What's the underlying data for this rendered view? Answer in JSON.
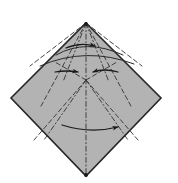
{
  "figure": {
    "type": "origami-folding-diagram",
    "canvas": {
      "width": 178,
      "height": 183,
      "background": "#ffffff"
    }
  },
  "colors": {
    "paper_fill": "#b3b3b3",
    "paper_outline": "#262626",
    "fold_line": "#333333",
    "arrow": "#1a1a1a",
    "background": "#ffffff"
  },
  "shape": {
    "name": "kite-diamond",
    "vertices": {
      "top": {
        "x": 86,
        "y": 23
      },
      "left": {
        "x": 11,
        "y": 98
      },
      "bottom": {
        "x": 86,
        "y": 176
      },
      "right": {
        "x": 161,
        "y": 98
      }
    },
    "points_attr": "86,23 161,98 86,176 11,98"
  },
  "nodes": {
    "apex": {
      "x": 86,
      "y": 23
    },
    "hub": {
      "x": 86,
      "y": 80
    },
    "left_anchor": {
      "x": 46,
      "y": 72
    },
    "right_anchor": {
      "x": 126,
      "y": 72
    }
  },
  "fold_lines": [
    {
      "name": "center-vertical-crease",
      "d": "M 86 23 L 86 176",
      "style": "dash-dot"
    },
    {
      "name": "apex-fan-left-outer",
      "d": "M 86 23 L 40 108",
      "style": "dashed"
    },
    {
      "name": "apex-fan-left-inner",
      "d": "M 86 23 L 63 82",
      "style": "dash-dot"
    },
    {
      "name": "apex-fan-right-inner",
      "d": "M 86 23 L 109 82",
      "style": "dash-dot"
    },
    {
      "name": "apex-fan-right-outer",
      "d": "M 86 23 L 132 108",
      "style": "dashed"
    },
    {
      "name": "hub-fan-left-outer",
      "d": "M 86 80 L 34 140",
      "style": "dashed"
    },
    {
      "name": "hub-fan-left-mid",
      "d": "M 86 80 L 44 140",
      "style": "dash-dot"
    },
    {
      "name": "hub-fan-right-mid",
      "d": "M 86 80 L 128 140",
      "style": "dash-dot"
    },
    {
      "name": "hub-fan-right-outer",
      "d": "M 86 80 L 138 140",
      "style": "dashed"
    },
    {
      "name": "upper-left-edge-crease",
      "d": "M 86 23 L 30 66",
      "style": "dashed"
    },
    {
      "name": "upper-right-edge-crease",
      "d": "M 86 23 L 142 66",
      "style": "dashed"
    },
    {
      "name": "hub-left-spur",
      "d": "M 86 80 L 55 62",
      "style": "dashed"
    },
    {
      "name": "hub-right-spur",
      "d": "M 86 80 L 117 62",
      "style": "dashed"
    }
  ],
  "arcs": [
    {
      "name": "upper-valley-arc",
      "d": "M 56 55 Q 86 38 123 55",
      "style": "solid"
    },
    {
      "name": "mid-wide-arc",
      "d": "M 40 66 Q 86 46 134 64",
      "style": "solid"
    }
  ],
  "arrows": [
    {
      "name": "upper-fold-arrow",
      "label": "fold top flap to the right",
      "direction": "right",
      "path": "M 66 48 Q 80 42 95 46",
      "head": {
        "x": 95,
        "y": 46,
        "angle": 18
      }
    },
    {
      "name": "left-converging-arrow",
      "label": "fold left side inward to center",
      "direction": "right",
      "path": "M 55 72 Q 66 70 78 72",
      "head": {
        "x": 79,
        "y": 72,
        "angle": 8
      }
    },
    {
      "name": "right-converging-arrow",
      "label": "fold right side inward to center",
      "direction": "left",
      "path": "M 118 72 Q 104 68 93 72",
      "head": {
        "x": 92,
        "y": 72,
        "angle": 188
      }
    },
    {
      "name": "lower-fold-arrow",
      "label": "fold lower flap across to the right",
      "direction": "right",
      "path": "M 62 125 Q 90 134 118 127",
      "head": {
        "x": 119,
        "y": 127,
        "angle": -14
      }
    }
  ],
  "vertex_dots": [
    {
      "name": "apex-dot",
      "x": 86,
      "y": 24
    },
    {
      "name": "bottom-dot",
      "x": 86,
      "y": 175
    }
  ]
}
